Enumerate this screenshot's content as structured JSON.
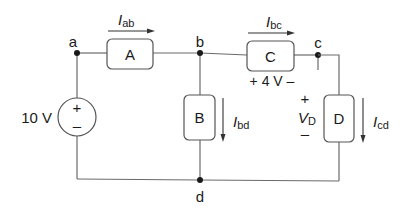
{
  "diagram": {
    "type": "circuit",
    "nodes": [
      {
        "id": "a",
        "label": "a"
      },
      {
        "id": "b",
        "label": "b"
      },
      {
        "id": "c",
        "label": "c"
      },
      {
        "id": "d",
        "label": "d"
      }
    ],
    "elements": {
      "A": {
        "label": "A",
        "between": [
          "a",
          "b"
        ]
      },
      "B": {
        "label": "B",
        "between": [
          "b",
          "d"
        ]
      },
      "C": {
        "label": "C",
        "between": [
          "b",
          "c"
        ],
        "voltage_label": "+ 4 V –"
      },
      "D": {
        "label": "D",
        "between": [
          "c",
          "d"
        ]
      }
    },
    "source": {
      "value_label": "10 V",
      "plus": "+",
      "minus": "–"
    },
    "currents": {
      "ab": {
        "main": "I",
        "sub": "ab"
      },
      "bc": {
        "main": "I",
        "sub": "bc"
      },
      "bd": {
        "main": "I",
        "sub": "bd"
      },
      "cd": {
        "main": "I",
        "sub": "cd"
      }
    },
    "vd": {
      "plus": "+",
      "main": "V",
      "sub": "D",
      "minus": "–"
    }
  }
}
